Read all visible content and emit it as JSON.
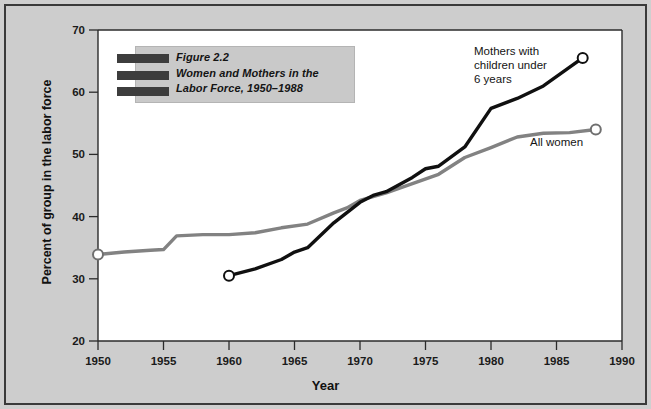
{
  "figure": {
    "caption_lines": [
      "Figure 2.2",
      "Women and Mothers in the",
      "Labor Force, 1950–1988"
    ],
    "background_color": "#cdcdcd",
    "frame_color": "#3a3a3a"
  },
  "annotations": {
    "mothers_lines": [
      "Mothers with",
      "children under",
      "6 years"
    ],
    "all_women": "All women"
  },
  "chart_data": {
    "type": "line",
    "xlabel": "Year",
    "ylabel": "Percent of group in the labor force",
    "xlim": [
      1950,
      1990
    ],
    "ylim": [
      20,
      70
    ],
    "xticks": [
      1950,
      1955,
      1960,
      1965,
      1970,
      1975,
      1980,
      1985,
      1990
    ],
    "yticks": [
      20,
      30,
      40,
      50,
      60,
      70
    ],
    "grid": false,
    "legend": "inline-annotations",
    "series": [
      {
        "name": "All women",
        "color": "#828282",
        "marker_endpoints": true,
        "x": [
          1950,
          1952,
          1954,
          1955,
          1956,
          1958,
          1960,
          1962,
          1964,
          1966,
          1968,
          1969,
          1970,
          1971,
          1972,
          1974,
          1976,
          1978,
          1980,
          1982,
          1984,
          1986,
          1988
        ],
        "y": [
          33.9,
          34.3,
          34.6,
          34.7,
          36.9,
          37.1,
          37.1,
          37.4,
          38.2,
          38.8,
          40.6,
          41.4,
          42.6,
          43.2,
          43.8,
          45.3,
          46.8,
          49.5,
          51.1,
          52.8,
          53.4,
          53.5,
          54.0
        ]
      },
      {
        "name": "Mothers with children under 6 years",
        "color": "#101010",
        "marker_endpoints": true,
        "x": [
          1960,
          1962,
          1964,
          1965,
          1966,
          1968,
          1970,
          1971,
          1972,
          1974,
          1975,
          1976,
          1978,
          1980,
          1982,
          1984,
          1987
        ],
        "y": [
          30.5,
          31.6,
          33.1,
          34.3,
          35.0,
          39.0,
          42.3,
          43.4,
          44.0,
          46.3,
          47.7,
          48.1,
          51.2,
          57.4,
          59.0,
          61.0,
          65.5
        ]
      }
    ]
  },
  "axis": {
    "x_tick_labels": [
      "1950",
      "1955",
      "1960",
      "1965",
      "1970",
      "1975",
      "1980",
      "1985",
      "1990"
    ],
    "y_tick_labels": [
      "20",
      "30",
      "40",
      "50",
      "60",
      "70"
    ],
    "x_title": "Year",
    "y_title": "Percent of group in the labor force"
  }
}
